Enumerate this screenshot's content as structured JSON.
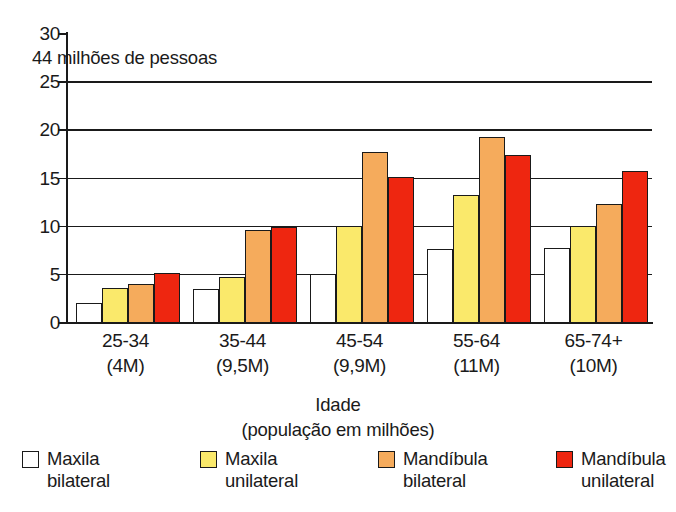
{
  "chart_data": {
    "type": "bar",
    "title": "",
    "annotation": "44 milhões de pessoas",
    "xlabel": "Idade",
    "xlabel_sub": "(população em milhões)",
    "ylabel": "",
    "ylim": [
      0,
      30
    ],
    "ytick_values": [
      0,
      5,
      10,
      15,
      20,
      25,
      30
    ],
    "ytick_labels": [
      "0",
      "5",
      "10",
      "15",
      "20",
      "25",
      "30"
    ],
    "grid": true,
    "legend_position": "bottom",
    "categories": [
      "25-34",
      "35-44",
      "45-54",
      "55-64",
      "65-74+"
    ],
    "category_sublabels": [
      "(4M)",
      "(9,5M)",
      "(9,9M)",
      "(11M)",
      "(10M)"
    ],
    "series": [
      {
        "name": "Maxila bilateral",
        "name_line1": "Maxila",
        "name_line2": "bilateral",
        "color": "#ffffff",
        "values": [
          2.0,
          3.4,
          5.0,
          7.6,
          7.7
        ]
      },
      {
        "name": "Maxila unilateral",
        "name_line1": "Maxila",
        "name_line2": "unilateral",
        "color": "#fae96b",
        "values": [
          3.5,
          4.7,
          10.0,
          13.2,
          10.0
        ]
      },
      {
        "name": "Mandíbula bilateral",
        "name_line1": "Mandíbula",
        "name_line2": "bilateral",
        "color": "#f5ab5c",
        "values": [
          3.9,
          9.5,
          17.6,
          19.2,
          12.2
        ]
      },
      {
        "name": "Mandíbula unilateral",
        "name_line1": "Mandíbula",
        "name_line2": "unilateral",
        "color": "#ee2610",
        "values": [
          5.1,
          9.9,
          15.1,
          17.3,
          15.7
        ]
      }
    ]
  }
}
